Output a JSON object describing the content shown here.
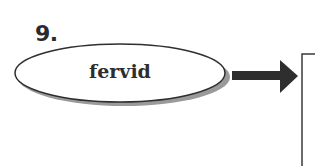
{
  "item": {
    "number": "9.",
    "word": "fervid"
  },
  "colors": {
    "ink": "#2e2e2e",
    "shadow": "#9a9a9a",
    "background": "#ffffff"
  },
  "icons": {
    "arrow": "right-arrow",
    "answer_box": "empty-box"
  }
}
